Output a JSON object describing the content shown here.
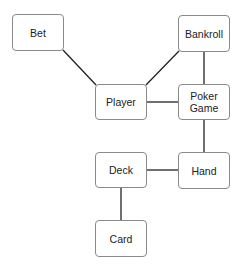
{
  "diagram": {
    "type": "class-association-diagram",
    "nodes": [
      {
        "id": "bet",
        "label": "Bet",
        "x": 12,
        "y": 14,
        "w": 52,
        "h": 37
      },
      {
        "id": "bankroll",
        "label": "Bankroll",
        "x": 178,
        "y": 15,
        "w": 52,
        "h": 37
      },
      {
        "id": "player",
        "label": "Player",
        "x": 95,
        "y": 84,
        "w": 52,
        "h": 36
      },
      {
        "id": "poker-game",
        "label": "Poker\nGame",
        "x": 178,
        "y": 84,
        "w": 52,
        "h": 36
      },
      {
        "id": "deck",
        "label": "Deck",
        "x": 95,
        "y": 152,
        "w": 52,
        "h": 36
      },
      {
        "id": "hand",
        "label": "Hand",
        "x": 178,
        "y": 152,
        "w": 52,
        "h": 37
      },
      {
        "id": "card",
        "label": "Card",
        "x": 95,
        "y": 220,
        "w": 52,
        "h": 37
      }
    ],
    "edges": [
      {
        "from": "bet",
        "to": "player",
        "x1": 63,
        "y1": 50,
        "x2": 96,
        "y2": 85
      },
      {
        "from": "bankroll",
        "to": "player",
        "x1": 179,
        "y1": 51,
        "x2": 146,
        "y2": 85
      },
      {
        "from": "bankroll",
        "to": "poker-game",
        "x1": 204,
        "y1": 52,
        "x2": 204,
        "y2": 84
      },
      {
        "from": "player",
        "to": "poker-game",
        "x1": 147,
        "y1": 102,
        "x2": 178,
        "y2": 102
      },
      {
        "from": "poker-game",
        "to": "hand",
        "x1": 204,
        "y1": 120,
        "x2": 204,
        "y2": 152
      },
      {
        "from": "deck",
        "to": "hand",
        "x1": 147,
        "y1": 170,
        "x2": 178,
        "y2": 170
      },
      {
        "from": "deck",
        "to": "card",
        "x1": 121,
        "y1": 188,
        "x2": 121,
        "y2": 220
      }
    ],
    "colors": {
      "line": "#222222",
      "border": "#8a8a8a",
      "text": "#222222"
    }
  }
}
